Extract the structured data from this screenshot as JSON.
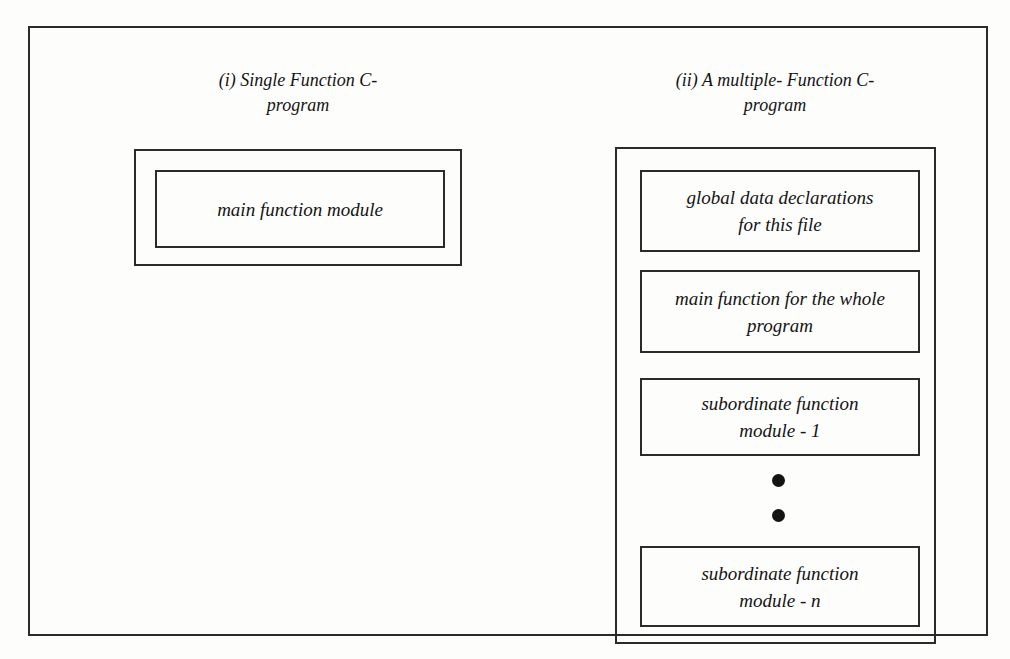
{
  "figure": {
    "background_color": "#fdfdfc",
    "line_color": "#2b2b2b",
    "text_color": "#141414"
  },
  "panels": [
    {
      "caption": "(i)  Single Function C-\nprogram",
      "boxes": [
        {
          "label": "main function module"
        }
      ]
    },
    {
      "caption": "(ii) A multiple- Function C-\nprogram",
      "boxes": [
        {
          "label": "global data declarations\nfor this file"
        },
        {
          "label": "main function for the whole\nprogram"
        },
        {
          "label": "subordinate function\nmodule - 1"
        },
        {
          "label": "subordinate function\nmodule - n"
        }
      ],
      "ellipsis_dots": 2
    }
  ]
}
